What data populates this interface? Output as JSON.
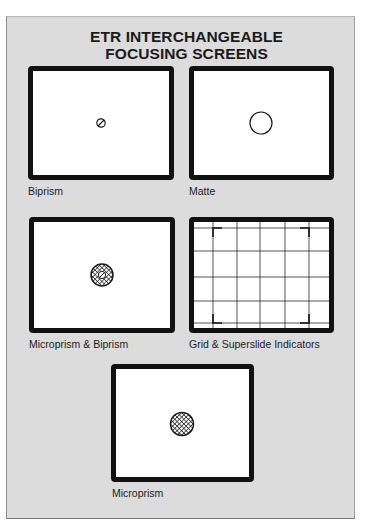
{
  "title": {
    "line1": "ETR INTERCHANGEABLE",
    "line2": "FOCUSING SCREENS"
  },
  "screens": [
    {
      "label": "Biprism",
      "center_icon": "biprism-split-circle-icon"
    },
    {
      "label": "Matte",
      "center_icon": "matte-circle-icon"
    },
    {
      "label": "Microprism & Biprism",
      "center_icon": "microprism-biprism-hatched-circle-icon"
    },
    {
      "label": "Grid & Superslide Indicators",
      "center_icon": "grid-with-corner-brackets-icon"
    },
    {
      "label": "Microprism",
      "center_icon": "microprism-hatched-circle-icon"
    }
  ],
  "colors": {
    "panel_background": "#dcdcdc",
    "frame_border": "#111111",
    "screen_background": "#ffffff",
    "text": "#1a1a1a"
  }
}
